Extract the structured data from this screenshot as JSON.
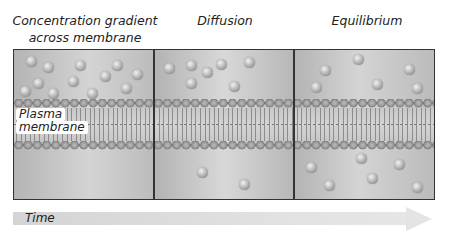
{
  "panels": [
    {
      "title_line1": "Concentration gradient",
      "title_line2": "across membrane"
    },
    {
      "title_line1": "Diffusion",
      "title_line2": ""
    },
    {
      "title_line1": "Equilibrium",
      "title_line2": ""
    }
  ],
  "membrane_label_line1": "Plasma",
  "membrane_label_line2": "membrane",
  "time_label": "Time",
  "colors": {
    "frame": "#333333",
    "background": "#c4c4c4",
    "arrow": "#e0e0e0"
  },
  "particles": {
    "panel1_above": 13,
    "panel1_below": 0,
    "panel2_above": 7,
    "panel2_below": 2,
    "panel3_above": 5,
    "panel3_below": 6
  }
}
